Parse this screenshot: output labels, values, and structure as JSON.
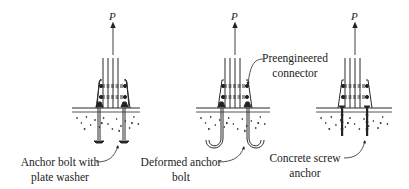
{
  "figure": {
    "type": "engineering-diagram",
    "load_label": "P",
    "panels": [
      {
        "id": "left",
        "load_label": "P",
        "callout": {
          "line1": "Anchor bolt with",
          "line2": "plate washer"
        },
        "anchor_type": "headed-bolt-with-plate-washer"
      },
      {
        "id": "middle",
        "load_label": "P",
        "callout": {
          "line1": "Deformed anchor",
          "line2": "bolt"
        },
        "anchor_type": "j-hook-bolt"
      },
      {
        "id": "right",
        "load_label": "P",
        "callout": {
          "line1": "Concrete screw",
          "line2": "anchor"
        },
        "anchor_type": "screw-anchor"
      }
    ],
    "shared_callout": {
      "line1": "Preengineered",
      "line2": "connector"
    },
    "colors": {
      "line": "#2a2a2a",
      "concrete_stipple": "#555555",
      "background": "#ffffff"
    }
  }
}
